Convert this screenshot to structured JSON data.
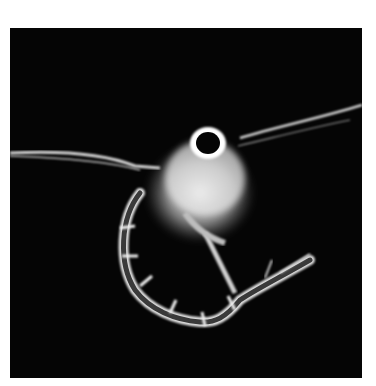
{
  "image": {
    "subject": "zooplankton larva (crustacean) micrograph",
    "background_color": "#050505",
    "border_color": "#ffffff",
    "subject_color": "#e8e8e8"
  }
}
